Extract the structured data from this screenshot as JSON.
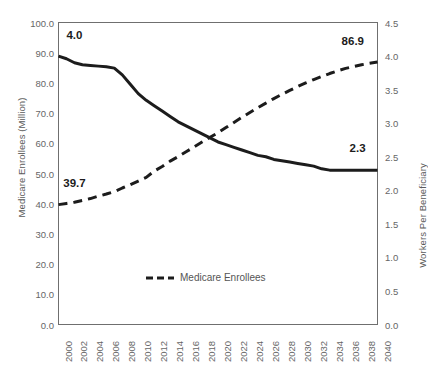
{
  "chart_data": {
    "type": "line",
    "title": "",
    "xlabel": "",
    "x_tick_labels": [
      "2000",
      "2002",
      "2004",
      "2006",
      "2008",
      "2010",
      "2012",
      "2014",
      "2016",
      "2018",
      "2020",
      "2022",
      "2024",
      "2026",
      "2028",
      "2030",
      "2032",
      "2034",
      "2036",
      "2038",
      "2040"
    ],
    "xlim": [
      2000,
      2040
    ],
    "grid": false,
    "legend_position": "bottom-center",
    "axes": {
      "left": {
        "label": "Medicare Enrollees (Million)",
        "ylim": [
          0.0,
          100.0
        ],
        "tick_labels": [
          "0.0",
          "10.0",
          "20.0",
          "30.0",
          "40.0",
          "50.0",
          "60.0",
          "70.0",
          "80.0",
          "90.0",
          "100.0"
        ],
        "tick_values": [
          0.0,
          10.0,
          20.0,
          30.0,
          40.0,
          50.0,
          60.0,
          70.0,
          80.0,
          90.0,
          100.0
        ]
      },
      "right": {
        "label": "Workers Per Beneficiary",
        "ylim": [
          0.0,
          4.5
        ],
        "tick_labels": [
          "0.0",
          "0.5",
          "1.0",
          "1.5",
          "2.0",
          "2.5",
          "3.0",
          "3.5",
          "4.0",
          "4.5"
        ],
        "tick_values": [
          0.0,
          0.5,
          1.0,
          1.5,
          2.0,
          2.5,
          3.0,
          3.5,
          4.0,
          4.5
        ]
      }
    },
    "series": [
      {
        "name": "Medicare Enrollees",
        "style": "dashed",
        "color": "#1c1c1c",
        "axis": "left",
        "x": [
          2000,
          2001,
          2002,
          2003,
          2004,
          2005,
          2006,
          2007,
          2008,
          2009,
          2010,
          2011,
          2012,
          2013,
          2014,
          2015,
          2016,
          2017,
          2018,
          2019,
          2020,
          2021,
          2022,
          2023,
          2024,
          2025,
          2026,
          2027,
          2028,
          2029,
          2030,
          2031,
          2032,
          2033,
          2034,
          2035,
          2036,
          2037,
          2038,
          2039,
          2040
        ],
        "values": [
          39.7,
          40.1,
          40.5,
          41.1,
          41.7,
          42.5,
          43.2,
          44.0,
          45.2,
          46.3,
          47.5,
          48.7,
          50.8,
          52.3,
          54.1,
          55.6,
          57.2,
          58.8,
          60.4,
          62.0,
          63.5,
          65.2,
          66.9,
          68.6,
          70.2,
          71.8,
          73.3,
          74.8,
          76.2,
          77.5,
          78.8,
          80.0,
          81.1,
          82.1,
          83.1,
          84.0,
          84.8,
          85.4,
          86.0,
          86.5,
          86.9
        ]
      },
      {
        "name": "Workers Per Beneficiary",
        "style": "solid",
        "color": "#1c1c1c",
        "axis": "right",
        "x": [
          2000,
          2001,
          2002,
          2003,
          2004,
          2005,
          2006,
          2007,
          2008,
          2009,
          2010,
          2011,
          2012,
          2013,
          2014,
          2015,
          2016,
          2017,
          2018,
          2019,
          2020,
          2021,
          2022,
          2023,
          2024,
          2025,
          2026,
          2027,
          2028,
          2029,
          2030,
          2031,
          2032,
          2033,
          2034,
          2035,
          2036,
          2037,
          2038,
          2039,
          2040
        ],
        "values": [
          4.0,
          3.96,
          3.9,
          3.87,
          3.86,
          3.85,
          3.84,
          3.82,
          3.72,
          3.58,
          3.44,
          3.34,
          3.26,
          3.18,
          3.1,
          3.02,
          2.96,
          2.9,
          2.84,
          2.78,
          2.72,
          2.68,
          2.64,
          2.6,
          2.56,
          2.52,
          2.5,
          2.46,
          2.44,
          2.42,
          2.4,
          2.38,
          2.36,
          2.32,
          2.3,
          2.3,
          2.3,
          2.3,
          2.3,
          2.3,
          2.3
        ]
      }
    ],
    "annotations": [
      {
        "name": "workers-start-label",
        "text": "4.0",
        "x": 2001,
        "y_axis": "right",
        "y": 4.3
      },
      {
        "name": "enrollees-start-label",
        "text": "39.7",
        "x": 2000.6,
        "y_axis": "left",
        "y": 46.5
      },
      {
        "name": "enrollees-end-label",
        "text": "86.9",
        "x": 2035.5,
        "y_axis": "left",
        "y": 93.5
      },
      {
        "name": "workers-end-label",
        "text": "2.3",
        "x": 2036.5,
        "y_axis": "right",
        "y": 2.62
      }
    ],
    "legend": [
      {
        "name": "Medicare Enrollees",
        "style": "dashed",
        "color": "#1c1c1c"
      }
    ]
  }
}
